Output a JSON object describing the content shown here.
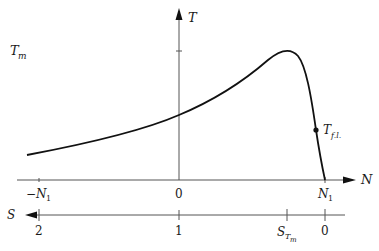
{
  "diagram": {
    "y_axis": {
      "label": "T",
      "marked_value": "T_m"
    },
    "x_axis_speed": {
      "label": "N",
      "ticks": [
        "-N_1",
        "0",
        "N_1"
      ]
    },
    "x_axis_slip": {
      "label": "S",
      "ticks": [
        "2",
        "1",
        "S_Tm",
        "0"
      ]
    },
    "point_label": "T_f.l.",
    "labels": {
      "T": "T",
      "Tm_main": "T",
      "Tm_sub": "m",
      "N": "N",
      "S": "S",
      "neg_N1_main": "−N",
      "neg_N1_sub": "1",
      "zero_N": "0",
      "N1_main": "N",
      "N1_sub": "1",
      "s_two": "2",
      "s_one": "1",
      "s_zero": "0",
      "STm_main": "S",
      "STm_sub": "T",
      "STm_subsub": "m",
      "Tfl_main": "T",
      "Tfl_sub": "f.l."
    }
  }
}
